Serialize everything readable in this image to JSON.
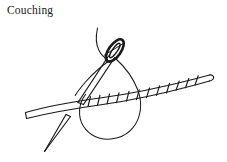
{
  "figure": {
    "title": "Couching",
    "background_color": "#ffffff",
    "ink_color": "#1a1a1a",
    "width": 227,
    "height": 162
  },
  "illustration": {
    "elements": [
      {
        "name": "laid-thread-bundle",
        "description": "thick laid thread running from lower-left to upper-right, blunt cut end at left, rounded tip at right"
      },
      {
        "name": "couching-stitches",
        "description": "short binding stitches crossing the laid thread on its right half",
        "count": 12
      },
      {
        "name": "needle-with-eye",
        "description": "tapered sewing needle angled from lower-left to upper-right with elongated oval eye near the top"
      },
      {
        "name": "needle-eye",
        "description": "elongated oval eye with thread passing through"
      },
      {
        "name": "working-thread-loop",
        "description": "teardrop shaped loop of working thread descending from the needle eye and passing behind the laid thread"
      },
      {
        "name": "working-thread-tail",
        "description": "single thread curving upward off the top of the figure from the needle eye"
      },
      {
        "name": "second-needle-point",
        "description": "thin needle point emerging below the laid thread toward the lower-left"
      }
    ]
  }
}
